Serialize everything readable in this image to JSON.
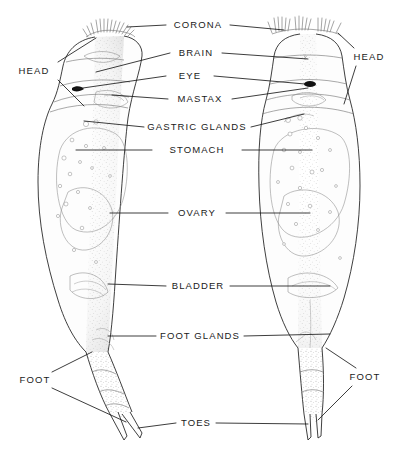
{
  "figure": {
    "background_color": "#ffffff",
    "ink_color": "#1a1a1a",
    "stipple_color": "#9a9a9a",
    "eye_color": "#111111",
    "views": [
      {
        "name": "left-specimen",
        "orientation": "lateral view"
      },
      {
        "name": "right-specimen",
        "orientation": "dorsal view"
      }
    ]
  },
  "center_labels": [
    {
      "id": "corona",
      "text": "CORONA",
      "y": 25
    },
    {
      "id": "brain",
      "text": "BRAIN",
      "y": 53
    },
    {
      "id": "eye",
      "text": "EYE",
      "y": 76
    },
    {
      "id": "mastax",
      "text": "MASTAX",
      "y": 99
    },
    {
      "id": "gastric-glands",
      "text": "GASTRIC GLANDS",
      "y": 127
    },
    {
      "id": "stomach",
      "text": "STOMACH",
      "y": 150
    },
    {
      "id": "ovary",
      "text": "OVARY",
      "y": 213
    },
    {
      "id": "bladder",
      "text": "BLADDER",
      "y": 286
    },
    {
      "id": "foot-glands",
      "text": "FOOT GLANDS",
      "y": 336
    },
    {
      "id": "toes",
      "text": "TOES",
      "y": 423
    }
  ],
  "side_labels": [
    {
      "id": "head-left",
      "text": "HEAD",
      "x": 34,
      "y": 71
    },
    {
      "id": "head-right",
      "text": "HEAD",
      "x": 369,
      "y": 57
    },
    {
      "id": "foot-left",
      "text": "FOOT",
      "x": 35,
      "y": 380
    },
    {
      "id": "foot-right",
      "text": "FOOT",
      "x": 365,
      "y": 377
    }
  ],
  "anatomy_parts": [
    "corona",
    "brain",
    "eye",
    "mastax",
    "gastric glands",
    "stomach",
    "ovary",
    "bladder",
    "foot glands",
    "toes",
    "head",
    "foot"
  ]
}
